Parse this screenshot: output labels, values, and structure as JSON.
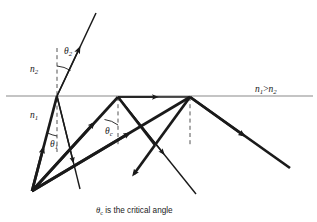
{
  "figure": {
    "caption": {
      "symbol": "θ",
      "symbol_subscript": "c",
      "text": " is the critical angle",
      "full": "θc is the critical angle"
    },
    "labels": {
      "n2": {
        "base": "n",
        "sub": "2",
        "full": "n2",
        "x": 30,
        "y": 72
      },
      "n1": {
        "base": "n",
        "sub": "1",
        "full": "n1",
        "x": 30,
        "y": 118
      },
      "theta2": {
        "base": "θ",
        "sub": "2",
        "full": "θ2",
        "x": 64,
        "y": 54
      },
      "theta1": {
        "base": "θ",
        "sub": "1",
        "full": "θ1",
        "x": 50,
        "y": 147
      },
      "theta_c": {
        "base": "θ",
        "sub": "c",
        "full": "θc",
        "x": 105,
        "y": 134
      },
      "inequality": {
        "full": "n1 > n2",
        "n_first": "n",
        "sub_first": "1",
        "operator": ">",
        "n_second": "n",
        "sub_second": "2",
        "x": 265,
        "y": 92
      }
    },
    "colors": {
      "ink": "#1a1a1a",
      "interface_line": "#8a8a8a",
      "dashed_normal": "#4a4a4a",
      "thin_ray": "#1a1a1a",
      "background": "#ffffff"
    },
    "geometry": {
      "interface_y": 96,
      "interface_x_start": 6,
      "interface_x_end": 313,
      "source_point": {
        "x": 32,
        "y": 191
      },
      "incidence_point_1": {
        "x": 57,
        "y": 96
      },
      "reflection_point_2": {
        "x": 118,
        "y": 97
      },
      "reflection_point_3": {
        "x": 190,
        "y": 97
      },
      "refracted_exit": {
        "x": 96,
        "y": 13
      },
      "normals": [
        {
          "x": 57,
          "y_top": 48,
          "y_bottom": 152
        },
        {
          "x": 118,
          "y_top": 97,
          "y_bottom": 146
        },
        {
          "x": 190,
          "y_top": 97,
          "y_bottom": 146
        }
      ]
    },
    "ray_segments": [
      {
        "name": "incident-ray-to-interface",
        "from": [
          32,
          191
        ],
        "to": [
          57,
          96
        ],
        "weight": "thick"
      },
      {
        "name": "refracted-ray-above-interface",
        "from": [
          57,
          96
        ],
        "to": [
          96,
          13
        ],
        "weight": "thin"
      },
      {
        "name": "internal-ray-source-to-second-point",
        "from": [
          32,
          191
        ],
        "to": [
          118,
          97
        ],
        "weight": "thick"
      },
      {
        "name": "reflected-ray-second-to-third-descent",
        "from": [
          118,
          97
        ],
        "to": [
          155,
          145
        ],
        "weight": "thick"
      },
      {
        "name": "reflected-ray-ascent-to-third-point",
        "from": [
          155,
          145
        ],
        "to": [
          190,
          97
        ],
        "weight": "thick"
      },
      {
        "name": "reflected-ray-third-descending",
        "from": [
          190,
          97
        ],
        "to": [
          290,
          168
        ],
        "weight": "thick"
      },
      {
        "name": "thin-ray-first-point-descending",
        "from": [
          57,
          96
        ],
        "to": [
          80,
          189
        ],
        "weight": "thin"
      },
      {
        "name": "thin-ray-second-point-descending",
        "from": [
          118,
          97
        ],
        "to": [
          196,
          194
        ],
        "weight": "thin"
      },
      {
        "name": "interface-traveling-ray",
        "from": [
          118,
          97
        ],
        "to": [
          190,
          97
        ],
        "weight": "thin"
      }
    ]
  }
}
